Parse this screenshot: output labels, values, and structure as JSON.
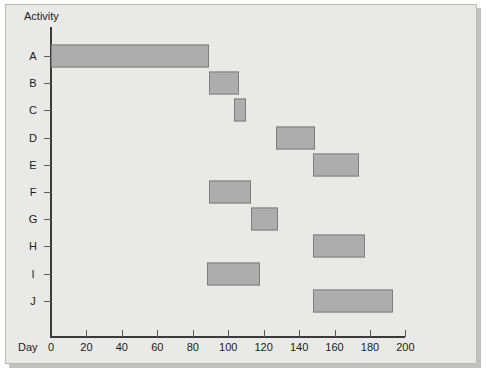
{
  "chart_data": {
    "type": "bar",
    "subtype": "gantt",
    "title": "",
    "xlabel": "Day",
    "ylabel": "Activity",
    "grid": false,
    "legend": null,
    "xlim": [
      0,
      200
    ],
    "xticks": [
      0,
      20,
      40,
      60,
      80,
      100,
      120,
      140,
      160,
      180,
      200
    ],
    "xtick_labels": [
      "0",
      "20",
      "40",
      "60",
      "80",
      "100",
      "120",
      "140",
      "160",
      "180",
      "200"
    ],
    "categories": [
      "A",
      "B",
      "C",
      "D",
      "E",
      "F",
      "G",
      "H",
      "I",
      "J"
    ],
    "bar_color": "#adadad",
    "bar_border_color": "#7e7e7e",
    "background_color": "#e9e9e7",
    "axis_color": "#3a3a3a",
    "tasks": [
      {
        "activity": "A",
        "start": 0,
        "end": 89,
        "duration": 89
      },
      {
        "activity": "B",
        "start": 89,
        "end": 106,
        "duration": 17
      },
      {
        "activity": "C",
        "start": 103,
        "end": 110,
        "duration": 7
      },
      {
        "activity": "D",
        "start": 127,
        "end": 149,
        "duration": 22
      },
      {
        "activity": "E",
        "start": 148,
        "end": 174,
        "duration": 26
      },
      {
        "activity": "F",
        "start": 89,
        "end": 113,
        "duration": 24
      },
      {
        "activity": "G",
        "start": 113,
        "end": 128,
        "duration": 15
      },
      {
        "activity": "H",
        "start": 148,
        "end": 177,
        "duration": 29
      },
      {
        "activity": "I",
        "start": 88,
        "end": 118,
        "duration": 30
      },
      {
        "activity": "J",
        "start": 148,
        "end": 193,
        "duration": 45
      }
    ]
  },
  "axes": {
    "y_caption": "Activity",
    "x_caption": "Day"
  }
}
